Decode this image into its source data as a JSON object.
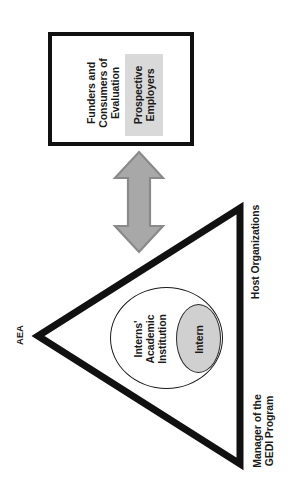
{
  "diagram": {
    "colors": {
      "stroke": "#111111",
      "text": "#1a1a1a",
      "arrow_fill": "#a8a8a8",
      "arrow_stroke": "#8a8a8a",
      "chip_fill": "#d9d9d9",
      "intern_fill": "#d0d0d0",
      "background": "#ffffff"
    },
    "stakeholder_box": {
      "funders_label": "Funders and\nConsumers of\nEvaluation",
      "funders_lines": [
        "Funders and",
        "Consumers of",
        "Evaluation"
      ],
      "employers_label": "Prospective\nEmployers",
      "employers_lines": [
        "Prospective",
        "Employers"
      ]
    },
    "connector": {
      "name": "double-headed-vertical-arrow",
      "direction": "bidirectional"
    },
    "triangle": {
      "vertex_labels": {
        "left": "AEA",
        "right_top": "Host Organizations",
        "right_bottom": "Manager of the\nGEDI Program",
        "right_bottom_lines": [
          "Manager of the",
          "GEDI Program"
        ]
      }
    },
    "inner_ellipses": {
      "outer_label": "Interns'\nAcademic\nInstitution",
      "outer_lines": [
        "Interns'",
        "Academic",
        "Institution"
      ],
      "inner_label": "Intern"
    }
  }
}
